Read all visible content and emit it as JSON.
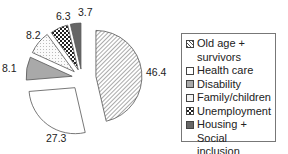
{
  "chart_data": {
    "type": "pie",
    "title": "",
    "exploded": true,
    "categories": [
      "Old age + survivors",
      "Health care",
      "Disability",
      "Family/children",
      "Unemployment",
      "Housing + Social inclusion"
    ],
    "values": [
      46.4,
      27.3,
      8.1,
      8.2,
      6.3,
      3.7
    ],
    "value_labels": [
      "46.4",
      "27.3",
      "8.1",
      "8.2",
      "6.3",
      "3.7"
    ],
    "start_angle": "12 o'clock",
    "direction": "clockwise",
    "legend_position": "right",
    "fills": [
      "diagonal-hatch",
      "white",
      "#a9a9a9",
      "light-dotted",
      "checkerboard",
      "#666666"
    ]
  },
  "legend": {
    "items": [
      {
        "label": "Old age + survivors",
        "line1": "Old age +",
        "line2": "survivors"
      },
      {
        "label": "Health care",
        "line1": "Health care",
        "line2": ""
      },
      {
        "label": "Disability",
        "line1": "Disability",
        "line2": ""
      },
      {
        "label": "Family/children",
        "line1": "Family/children",
        "line2": ""
      },
      {
        "label": "Unemployment",
        "line1": "Unemployment",
        "line2": ""
      },
      {
        "label": "Housing + Social inclusion",
        "line1": "Housing + Social",
        "line2": "inclusion"
      }
    ]
  }
}
